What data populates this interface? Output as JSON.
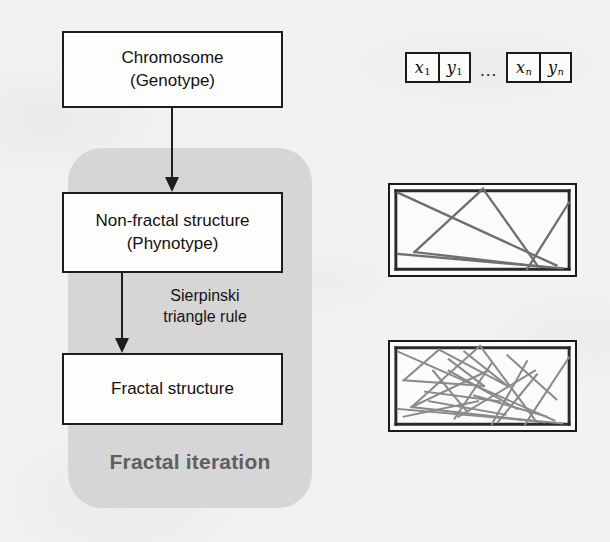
{
  "figure": {
    "background_color": "#f3f2f0",
    "panel_color": "#d6d6d6",
    "line_color": "#1d1d1d",
    "label_gray": "#5f5f5f"
  },
  "flow": {
    "chromosome_box": {
      "title": "Chromosome",
      "subtitle": "(Genotype)"
    },
    "nonfractal_box": {
      "title": "Non-fractal structure",
      "subtitle": "(Phynotype)"
    },
    "fractal_box": {
      "title": "Fractal structure",
      "subtitle": ""
    },
    "rule_label": {
      "line1": "Sierpinski",
      "line2": "triangle rule"
    },
    "panel_label": "Fractal iteration"
  },
  "chromosome_strip": {
    "first_gene": {
      "x": "x",
      "x_sub": "1",
      "y": "y",
      "y_sub": "1"
    },
    "ellipsis": "...",
    "last_gene": {
      "x": "x",
      "x_sub": "n",
      "y": "y",
      "y_sub": "n"
    }
  },
  "structures": {
    "nonfractal": {
      "caption": "",
      "segments": [
        [
          6,
          6,
          183,
          6
        ],
        [
          6,
          6,
          6,
          88
        ],
        [
          6,
          88,
          183,
          88
        ],
        [
          183,
          6,
          183,
          88
        ],
        [
          8,
          8,
          170,
          84
        ],
        [
          95,
          4,
          25,
          70
        ],
        [
          25,
          70,
          160,
          86
        ],
        [
          95,
          4,
          152,
          86
        ],
        [
          183,
          18,
          140,
          88
        ],
        [
          8,
          72,
          176,
          87
        ]
      ]
    },
    "fractal": {
      "caption": "",
      "segments": [
        [
          6,
          6,
          183,
          6
        ],
        [
          6,
          6,
          6,
          86
        ],
        [
          6,
          86,
          183,
          86
        ],
        [
          183,
          6,
          183,
          86
        ],
        [
          8,
          10,
          168,
          82
        ],
        [
          92,
          4,
          22,
          68
        ],
        [
          22,
          68,
          158,
          84
        ],
        [
          92,
          4,
          150,
          84
        ],
        [
          183,
          16,
          138,
          86
        ],
        [
          8,
          70,
          176,
          85
        ],
        [
          50,
          8,
          14,
          40
        ],
        [
          14,
          40,
          96,
          46
        ],
        [
          50,
          8,
          120,
          46
        ],
        [
          96,
          46,
          60,
          18
        ],
        [
          120,
          46,
          76,
          10
        ],
        [
          22,
          68,
          100,
          30
        ],
        [
          36,
          52,
          112,
          62
        ],
        [
          60,
          30,
          130,
          70
        ],
        [
          140,
          20,
          104,
          86
        ],
        [
          120,
          14,
          170,
          60
        ],
        [
          150,
          34,
          110,
          84
        ],
        [
          40,
          62,
          118,
          76
        ],
        [
          70,
          78,
          148,
          30
        ],
        [
          14,
          78,
          90,
          62
        ],
        [
          86,
          56,
          160,
          78
        ],
        [
          44,
          30,
          78,
          72
        ],
        [
          104,
          22,
          66,
          80
        ]
      ]
    }
  }
}
